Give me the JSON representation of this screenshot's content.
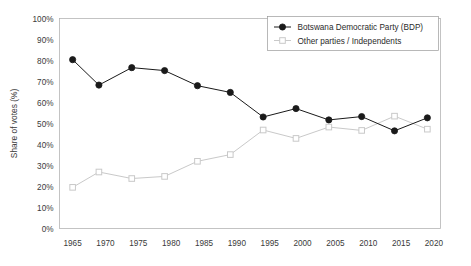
{
  "chart_data": {
    "type": "line",
    "title": "",
    "xlabel": "",
    "ylabel": "Share of votes (%)",
    "xlim": [
      1963,
      2021
    ],
    "ylim": [
      0,
      100
    ],
    "grid": true,
    "legend_position": "top-right",
    "x_ticks": [
      "1965",
      "1970",
      "1975",
      "1980",
      "1985",
      "1990",
      "1995",
      "2000",
      "2005",
      "2010",
      "2015",
      "2020"
    ],
    "x_tick_values": [
      1965,
      1970,
      1975,
      1980,
      1985,
      1990,
      1995,
      2000,
      2005,
      2010,
      2015,
      2020
    ],
    "y_ticks": [
      "0%",
      "10%",
      "20%",
      "30%",
      "40%",
      "50%",
      "60%",
      "70%",
      "80%",
      "90%",
      "100%"
    ],
    "y_tick_values": [
      0,
      10,
      20,
      30,
      40,
      50,
      60,
      70,
      80,
      90,
      100
    ],
    "x": [
      1965,
      1969,
      1974,
      1979,
      1984,
      1989,
      1994,
      1999,
      2004,
      2009,
      2014,
      2019
    ],
    "series": [
      {
        "name": "Botswana Democratic Party (BDP)",
        "color": "#1a1a1a",
        "marker": "filled-circle",
        "values": [
          80.4,
          68.3,
          76.6,
          75.2,
          68.0,
          64.8,
          53.1,
          57.1,
          51.7,
          53.3,
          46.5,
          52.7
        ]
      },
      {
        "name": "Other parties / Independents",
        "color": "#c9c9c9",
        "marker": "open-square",
        "values": [
          19.6,
          26.9,
          23.8,
          24.8,
          32.0,
          35.2,
          46.9,
          42.9,
          48.3,
          46.7,
          53.5,
          47.3
        ]
      }
    ]
  },
  "legend": {
    "items": [
      {
        "label": "Botswana Democratic Party (BDP)"
      },
      {
        "label": "Other parties / Independents"
      }
    ]
  },
  "axes": {
    "y_title": "Share of votes (%)"
  }
}
